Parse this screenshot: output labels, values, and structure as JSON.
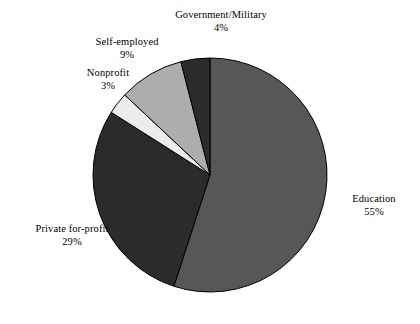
{
  "chart_data": {
    "type": "pie",
    "title": "",
    "subtitle": "",
    "xlabel": "",
    "ylabel": "",
    "legend_position": "none",
    "grid": false,
    "label_format": "name + percent",
    "start_angle_deg": 0,
    "direction": "clockwise",
    "categories": [
      "Education",
      "Private for-profit",
      "Nonprofit",
      "Self-employed",
      "Government/Military"
    ],
    "values": [
      55,
      29,
      3,
      9,
      4
    ],
    "units": "%",
    "slices": [
      {
        "label": "Education",
        "percent": 55,
        "percent_text": "55%",
        "color": "#575757"
      },
      {
        "label": "Private for-profit",
        "percent": 29,
        "percent_text": "29%",
        "color": "#2b2b2b"
      },
      {
        "label": "Nonprofit",
        "percent": 3,
        "percent_text": "3%",
        "color": "#ececec"
      },
      {
        "label": "Self-employed",
        "percent": 9,
        "percent_text": "9%",
        "color": "#adadad"
      },
      {
        "label": "Government/Military",
        "percent": 4,
        "percent_text": "4%",
        "color": "#2b2b2b"
      }
    ],
    "colors": {
      "education": "#575757",
      "private_for_profit": "#2b2b2b",
      "nonprofit": "#ececec",
      "self_employed": "#adadad",
      "government_military": "#2b2b2b",
      "outline": "#000000",
      "background": "#ffffff",
      "text": "#000000"
    },
    "geometry": {
      "center_x": 210,
      "center_y": 175,
      "radius": 117
    }
  }
}
